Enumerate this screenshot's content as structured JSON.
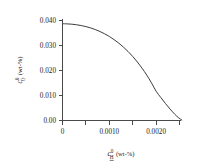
{
  "chart_data": {
    "type": "line",
    "title": "",
    "subtitle": "",
    "xlabel": "c0H (wt-%)",
    "ylabel": "c0O (wt-%)",
    "xlabel_parts": {
      "symbol": "c",
      "superscript": "0",
      "subscript": "H",
      "unit": "(wt-%)"
    },
    "ylabel_parts": {
      "symbol": "c",
      "superscript": "0",
      "subscript": "O",
      "unit": "(wt-%)"
    },
    "xlim": [
      0,
      0.0026
    ],
    "ylim": [
      0,
      0.0425
    ],
    "xticks": [
      0,
      0.0005,
      0.001,
      0.0015,
      0.002,
      0.0025
    ],
    "xtick_labels": [
      "0",
      "",
      "0.0010",
      "",
      "0.0020",
      ""
    ],
    "yticks": [
      0,
      0.01,
      0.02,
      0.03,
      0.04
    ],
    "ytick_labels": [
      "0.00",
      "0.010",
      "0.020",
      "0.030",
      "0.040"
    ],
    "grid": false,
    "legend": null,
    "series": [
      {
        "name": "oxygen-hydrogen equilibrium",
        "x": [
          0.0,
          0.0001,
          0.0002,
          0.0003,
          0.0004,
          0.0005,
          0.0006,
          0.0007,
          0.0008,
          0.0009,
          0.001,
          0.0011,
          0.0012,
          0.0013,
          0.0014,
          0.0015,
          0.0016,
          0.0017,
          0.0018,
          0.0019,
          0.002,
          0.0021,
          0.0022,
          0.0023,
          0.0024,
          0.00248,
          0.00255
        ],
        "y": [
          0.0385,
          0.03845,
          0.03832,
          0.0381,
          0.03778,
          0.03736,
          0.03683,
          0.03618,
          0.0354,
          0.03448,
          0.03341,
          0.03218,
          0.03078,
          0.0292,
          0.02742,
          0.02543,
          0.0232,
          0.02072,
          0.01796,
          0.0149,
          0.01152,
          0.00902,
          0.0066,
          0.00435,
          0.0023,
          0.0009,
          0.0
        ]
      }
    ]
  },
  "axes_style": {
    "spines": [
      "left",
      "bottom"
    ],
    "tick_direction": "out",
    "line_color": "#3c3c3c",
    "axis_color": "#4a4a4a",
    "background": "#ffffff"
  }
}
